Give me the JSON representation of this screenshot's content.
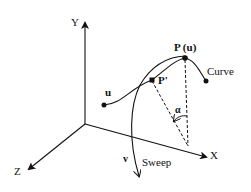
{
  "diagram": {
    "axes": {
      "x_label": "X",
      "y_label": "Y",
      "z_label": "Z"
    },
    "points": {
      "p_u_label": "P (u)",
      "p_prime_label": "P'",
      "u_label": "u",
      "v_label": "v"
    },
    "curve_label": "Curve",
    "sweep_label": "Sweep",
    "angle_label": "α",
    "colors": {
      "ink": "#111111",
      "background": "#ffffff"
    }
  }
}
